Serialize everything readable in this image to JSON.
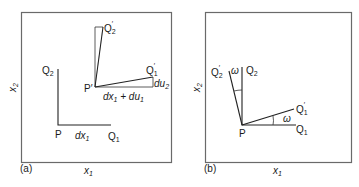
{
  "figure": {
    "panels": [
      {
        "id": "a",
        "tag": "(a)",
        "x_axis": {
          "label": "x",
          "sub": "1"
        },
        "y_axis": {
          "label": "x",
          "sub": "2"
        },
        "points": {
          "P": {
            "label": "P"
          },
          "Q1": {
            "label": "Q",
            "sub": "1"
          },
          "Q2": {
            "label": "Q",
            "sub": "2"
          },
          "P_prime": {
            "label": "P′"
          },
          "Q1_prime": {
            "label": "Q",
            "sub": "1",
            "prime": "′"
          },
          "Q2_prime": {
            "label": "Q",
            "sub": "2",
            "prime": "′"
          }
        },
        "annotations": {
          "dx1": {
            "text": "dx",
            "sub": "1"
          },
          "dx1_du1": {
            "part1": "dx",
            "sub1": "1",
            "plus": " + du",
            "sub2": "1"
          },
          "du2": {
            "text": "du",
            "sub": "2"
          }
        }
      },
      {
        "id": "b",
        "tag": "(b)",
        "x_axis": {
          "label": "x",
          "sub": "1"
        },
        "y_axis": {
          "label": "x",
          "sub": "2"
        },
        "points": {
          "P": {
            "label": "P"
          },
          "Q1": {
            "label": "Q",
            "sub": "1"
          },
          "Q2": {
            "label": "Q",
            "sub": "2"
          },
          "Q1_prime": {
            "label": "Q",
            "sub": "1",
            "prime": "′"
          },
          "Q2_prime": {
            "label": "Q",
            "sub": "2",
            "prime": "′"
          }
        },
        "annotations": {
          "omega_top": "ω",
          "omega_right": "ω"
        }
      }
    ]
  }
}
